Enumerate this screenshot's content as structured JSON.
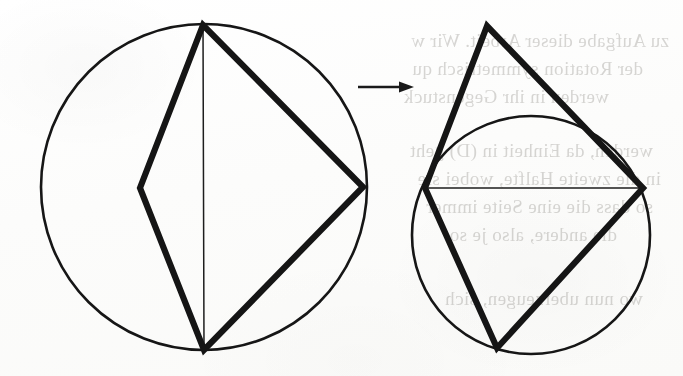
{
  "page": {
    "width": 683,
    "height": 376,
    "background_color": "#fdfdfc",
    "ink_color": "#151515",
    "bleed_text_color": "#7d7a74"
  },
  "figure": {
    "caption": "",
    "arrow": {
      "name": "transformation-arrow",
      "from_x": 358,
      "to_x": 414,
      "y": 87,
      "label": ""
    },
    "left_panel": {
      "name": "inscribed-kite-in-circle",
      "circle": {
        "cx": 204,
        "cy": 187,
        "r": 163
      },
      "vertices": {
        "top": {
          "x": 203,
          "y": 25
        },
        "left": {
          "x": 140,
          "y": 188
        },
        "right": {
          "x": 363,
          "y": 187
        },
        "bottom": {
          "x": 204,
          "y": 350
        }
      },
      "chord": {
        "x1": 203,
        "y1": 25,
        "x2": 204,
        "y2": 350,
        "style": "thin"
      },
      "quadrilateral_order": [
        "top",
        "left",
        "bottom",
        "right"
      ]
    },
    "right_panel": {
      "name": "reflected-kite-over-circle",
      "circle": {
        "cx": 531,
        "cy": 235,
        "r": 119
      },
      "vertices": {
        "top": {
          "x": 487,
          "y": 26
        },
        "left": {
          "x": 425,
          "y": 188
        },
        "right": {
          "x": 643,
          "y": 188
        },
        "bottom": {
          "x": 497,
          "y": 348
        }
      },
      "chord": {
        "x1": 425,
        "y1": 188,
        "x2": 643,
        "y2": 188,
        "style": "thin"
      },
      "quadrilateral_order": [
        "top",
        "left",
        "bottom",
        "right"
      ]
    }
  },
  "bleed_text": {
    "note": "Mirror-reversed show-through from the page verso; rendered faint and flipped horizontally.",
    "lines": [
      {
        "text": "zu Aufgabe dieser Arbeit. Wir w",
        "x": 14,
        "y": 30,
        "size": 19
      },
      {
        "text": "der Rotation symmetrisch qu",
        "x": 40,
        "y": 58,
        "size": 19
      },
      {
        "text": "werden in ihr Gegenstuck",
        "x": 74,
        "y": 86,
        "size": 19
      },
      {
        "text": "werden, da Einheit in (D) geht",
        "x": 30,
        "y": 140,
        "size": 19
      },
      {
        "text": "in die zweite Halfte, wobei sie",
        "x": 22,
        "y": 168,
        "size": 19
      },
      {
        "text": "so dass die eine Seite immer",
        "x": 30,
        "y": 196,
        "size": 19
      },
      {
        "text": "die andere, also je so",
        "x": 66,
        "y": 224,
        "size": 19
      },
      {
        "text": "wo nun uberzeugen, sich",
        "x": 40,
        "y": 288,
        "size": 19
      }
    ]
  }
}
